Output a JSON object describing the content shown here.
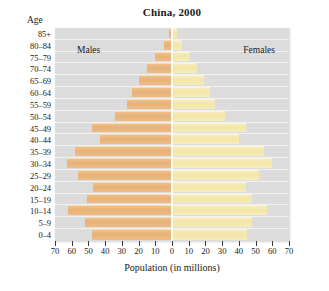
{
  "figure": {
    "title": "China, 2000",
    "age_axis_caption": "Age",
    "x_axis_title": "Population (in millions)",
    "male_label": "Males",
    "female_label": "Females",
    "colors": {
      "male_bar": "#e8b175",
      "female_bar": "#f2e6a6",
      "plot_background": "#dcdcdc",
      "gridline": "#f2f2f2",
      "zero_line": "#fdfcf4",
      "text": "#1a1a1a"
    }
  },
  "chart_data": {
    "type": "bar",
    "subtype": "population-pyramid",
    "title": "China, 2000",
    "xlabel": "Population (in millions)",
    "ylabel": "Age",
    "xlim": [
      -70,
      70
    ],
    "xticks": [
      -70,
      -60,
      -50,
      -40,
      -30,
      -20,
      -10,
      0,
      10,
      20,
      30,
      40,
      50,
      60,
      70
    ],
    "xtick_labels": [
      "70",
      "60",
      "50",
      "40",
      "30",
      "20",
      "10",
      "0",
      "10",
      "20",
      "30",
      "40",
      "50",
      "60",
      "70"
    ],
    "grid": true,
    "legend": "none",
    "annotations": [
      "Males",
      "Females"
    ],
    "categories": [
      "0–4",
      "5–9",
      "10–14",
      "15–19",
      "20–24",
      "25–29",
      "30–34",
      "35–39",
      "40–44",
      "45–49",
      "50–54",
      "55–59",
      "60–64",
      "65–69",
      "70–74",
      "75–79",
      "80–84",
      "85+"
    ],
    "series": [
      {
        "name": "Males",
        "side": "left",
        "values": [
          48,
          52,
          62,
          51,
          47,
          56,
          63,
          58,
          43,
          48,
          34,
          27,
          24,
          20,
          15,
          10,
          5,
          2
        ]
      },
      {
        "name": "Females",
        "side": "right",
        "values": [
          45,
          48,
          57,
          48,
          44,
          52,
          60,
          55,
          40,
          44,
          32,
          26,
          23,
          19,
          15,
          11,
          6,
          3
        ]
      }
    ]
  }
}
